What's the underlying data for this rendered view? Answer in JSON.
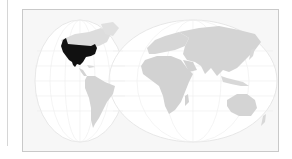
{
  "map": {
    "projection": "interrupted-two-lobe",
    "highlighted_region": "North America (United States and Mexico)",
    "colors": {
      "background": "#f7f7f7",
      "ocean": "#ffffff",
      "land": "#d4d4d4",
      "highlight": "#111111",
      "graticule": "#e6e6e6",
      "frame": "#c9c9c9"
    }
  }
}
